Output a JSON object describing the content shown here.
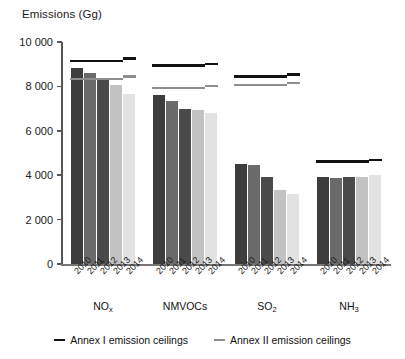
{
  "chart_data": {
    "type": "bar",
    "title": "Emissions (Gg)",
    "xlabel": "",
    "ylabel": "Emissions (Gg)",
    "ylim": [
      0,
      10000
    ],
    "ytick_labels": [
      "10 000",
      "8 000",
      "6 000",
      "4 000",
      "2 000",
      "0"
    ],
    "ytick_values": [
      10000,
      8000,
      6000,
      4000,
      2000,
      0
    ],
    "grid": false,
    "legend_position": "bottom",
    "categories": [
      "NO",
      "NMVOCs",
      "SO",
      "NH"
    ],
    "category_labels_html": [
      "NO<sub>x</sub>",
      "NMVOCs",
      "SO<sub>2</sub>",
      "NH<sub>3</sub>"
    ],
    "x": [
      "2010",
      "2011",
      "2012",
      "2013",
      "2014"
    ],
    "series": [
      {
        "name": "2010",
        "color": "#3d3d3d",
        "values": [
          8850,
          7600,
          4500,
          3900
        ]
      },
      {
        "name": "2011",
        "color": "#6a6a6a",
        "values": [
          8600,
          7350,
          4480,
          3880
        ]
      },
      {
        "name": "2012",
        "color": "#4a4a4a",
        "values": [
          8300,
          7000,
          3900,
          3900
        ]
      },
      {
        "name": "2013",
        "color": "#c2c2c2",
        "values": [
          8050,
          6950,
          3320,
          3920
        ]
      },
      {
        "name": "2014",
        "color": "#e2e2e2",
        "values": [
          7650,
          6800,
          3150,
          4020
        ]
      }
    ],
    "annotations": [
      {
        "label": "Annex I emission ceilings",
        "group": "NO",
        "value": 9080,
        "value_end": 9200
      },
      {
        "label": "Annex II emission ceilings",
        "group": "NO",
        "value": 8280,
        "value_end": 8380
      },
      {
        "label": "Annex I emission ceilings",
        "group": "NMVOCs",
        "value": 8880,
        "value_end": 8950
      },
      {
        "label": "Annex II emission ceilings",
        "group": "NMVOCs",
        "value": 7880,
        "value_end": 7960
      },
      {
        "label": "Annex I emission ceilings",
        "group": "SO",
        "value": 8380,
        "value_end": 8480
      },
      {
        "label": "Annex II emission ceilings",
        "group": "SO",
        "value": 8000,
        "value_end": 8100
      },
      {
        "label": "Annex I emission ceilings",
        "group": "NH",
        "value": 4560,
        "value_end": 4620
      }
    ]
  },
  "legend": {
    "items": [
      {
        "label": "Annex I emission ceilings",
        "color": "#121212"
      },
      {
        "label": "Annex II emission ceilings",
        "color": "#8e8e8e"
      }
    ]
  }
}
